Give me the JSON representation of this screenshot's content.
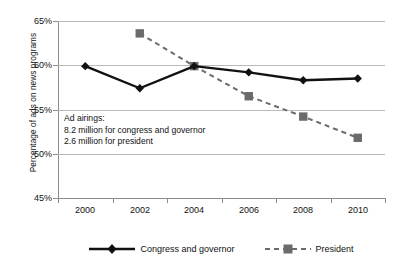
{
  "chart_data": {
    "type": "line",
    "title": "",
    "xlabel": "",
    "ylabel": "Percentage of ads on news programs",
    "categories": [
      "2000",
      "2002",
      "2004",
      "2006",
      "2008",
      "2010"
    ],
    "ylim": [
      45,
      65
    ],
    "ytick_values": [
      65,
      60,
      55,
      50,
      45
    ],
    "ytick_labels": [
      "65%",
      "60%",
      "55%",
      "50%",
      "45%"
    ],
    "grid": "horizontal",
    "legend_position": "bottom",
    "series": [
      {
        "name": "Congress and governor",
        "color": "#111111",
        "line_style": "solid",
        "marker": "diamond",
        "x": [
          "2000",
          "2002",
          "2004",
          "2006",
          "2008",
          "2010"
        ],
        "values": [
          59.9,
          57.4,
          59.9,
          59.2,
          58.3,
          58.5
        ]
      },
      {
        "name": "President",
        "color": "#6b6b6b",
        "line_style": "dashed",
        "marker": "square",
        "x": [
          "2002",
          "2004",
          "2006",
          "2008",
          "2010"
        ],
        "values": [
          63.6,
          59.9,
          56.5,
          54.2,
          51.8
        ]
      }
    ],
    "annotations": [
      "Ad airings:",
      "8.2 million for congress and governor",
      "2.6 million for president"
    ]
  },
  "axes": {
    "y_title": "Percentage of ads on news programs",
    "y_ticks": [
      "65%",
      "60%",
      "55%",
      "50%",
      "45%"
    ],
    "x_ticks": [
      "2000",
      "2002",
      "2004",
      "2006",
      "2008",
      "2010"
    ]
  },
  "annotation": {
    "line1": "Ad airings:",
    "line2": "8.2 million for congress and governor",
    "line3": "2.6 million for president"
  },
  "legend": {
    "items": [
      {
        "label": "Congress and governor"
      },
      {
        "label": "President"
      }
    ]
  },
  "colors": {
    "congress": "#111111",
    "president": "#6b6b6b",
    "gridline": "#b9b9b9",
    "axis": "#8c8c8c",
    "background": "#ffffff"
  }
}
